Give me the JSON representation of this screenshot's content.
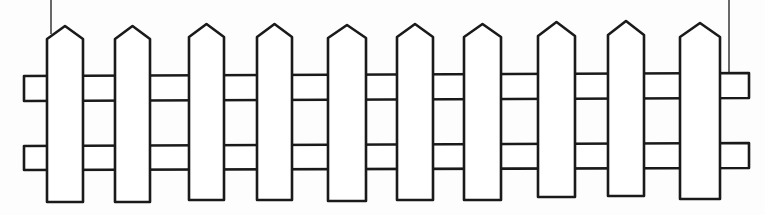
{
  "illustration": {
    "subject": "picket fence line drawing",
    "canvas": {
      "width": 765,
      "height": 215,
      "background": "#fdfdfd"
    },
    "colors": {
      "stroke": "#1a1a1a",
      "fill": "#ffffff"
    },
    "hanging_lines": [
      {
        "x": 51,
        "y1": 0,
        "y2": 34
      },
      {
        "x": 729,
        "y1": 0,
        "y2": 72
      }
    ],
    "rails": {
      "left_end": 24,
      "right_end": 749,
      "top": {
        "y_top_left": 76,
        "y_bottom_left": 101,
        "y_top_right": 73,
        "y_bottom_right": 98
      },
      "bottom": {
        "y_top_left": 146,
        "y_bottom_left": 170,
        "y_top_right": 143,
        "y_bottom_right": 168
      }
    },
    "pickets": [
      {
        "left": 47,
        "right": 83,
        "tip_y": 26,
        "shoulder_y": 39,
        "bottom_y": 202
      },
      {
        "left": 115,
        "right": 150,
        "tip_y": 26,
        "shoulder_y": 39,
        "bottom_y": 202
      },
      {
        "left": 189,
        "right": 224,
        "tip_y": 24,
        "shoulder_y": 37,
        "bottom_y": 200
      },
      {
        "left": 257,
        "right": 292,
        "tip_y": 24,
        "shoulder_y": 37,
        "bottom_y": 200
      },
      {
        "left": 328,
        "right": 366,
        "tip_y": 25,
        "shoulder_y": 38,
        "bottom_y": 201
      },
      {
        "left": 397,
        "right": 433,
        "tip_y": 24,
        "shoulder_y": 37,
        "bottom_y": 200
      },
      {
        "left": 464,
        "right": 501,
        "tip_y": 24,
        "shoulder_y": 37,
        "bottom_y": 200
      },
      {
        "left": 538,
        "right": 575,
        "tip_y": 22,
        "shoulder_y": 36,
        "bottom_y": 197
      },
      {
        "left": 608,
        "right": 644,
        "tip_y": 21,
        "shoulder_y": 35,
        "bottom_y": 196
      },
      {
        "left": 680,
        "right": 720,
        "tip_y": 23,
        "shoulder_y": 37,
        "bottom_y": 199
      }
    ]
  }
}
